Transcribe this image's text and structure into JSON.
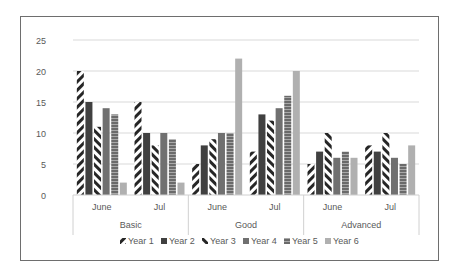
{
  "chart_data": {
    "type": "bar",
    "title": "",
    "xlabel": "",
    "ylabel": "",
    "ylim": [
      0,
      25
    ],
    "yticks": [
      0,
      5,
      10,
      15,
      20,
      25
    ],
    "grid": true,
    "legend_position": "bottom",
    "groups": [
      {
        "label": "Basic",
        "categories": [
          "June",
          "Jul"
        ]
      },
      {
        "label": "Good",
        "categories": [
          "June",
          "Jul"
        ]
      },
      {
        "label": "Advanced",
        "categories": [
          "June",
          "Jul"
        ]
      }
    ],
    "categories": [
      "Basic / June",
      "Basic / Jul",
      "Good / June",
      "Good / Jul",
      "Advanced / June",
      "Advanced / Jul"
    ],
    "series": [
      {
        "name": "Year 1",
        "pattern": "wide-diagonal-dark",
        "values": [
          20,
          15,
          5,
          7,
          5,
          8
        ]
      },
      {
        "name": "Year 2",
        "pattern": "solid-dark",
        "values": [
          15,
          10,
          8,
          13,
          7,
          7
        ]
      },
      {
        "name": "Year 3",
        "pattern": "wide-diagonal-dark-alt",
        "values": [
          11,
          8,
          9,
          12,
          10,
          10
        ]
      },
      {
        "name": "Year 4",
        "pattern": "solid-medium",
        "values": [
          14,
          10,
          10,
          14,
          6,
          6
        ]
      },
      {
        "name": "Year 5",
        "pattern": "horizontal-lines",
        "values": [
          13,
          9,
          10,
          16,
          7,
          5
        ]
      },
      {
        "name": "Year 6",
        "pattern": "solid-light",
        "values": [
          2,
          2,
          22,
          20,
          6,
          8
        ]
      }
    ]
  },
  "colors": {
    "dark": "#404040",
    "medium": "#707070",
    "light": "#b0b0b0",
    "grid": "#d9d9d9",
    "axis_text": "#595959"
  }
}
